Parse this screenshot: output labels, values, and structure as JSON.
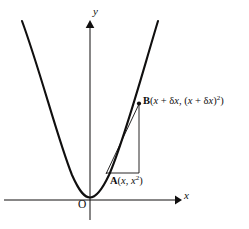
{
  "figure": {
    "background_color": "#ffffff",
    "stroke_color": "#100f0f",
    "width": 249,
    "height": 229
  },
  "axes": {
    "x_label": "x",
    "y_label": "y",
    "origin_label": "O",
    "x_axis": {
      "y": 200,
      "x_start": 4,
      "x_end": 178,
      "arrow": "right"
    },
    "y_axis": {
      "x": 90,
      "y_start": 220,
      "y_end": 22,
      "arrow": "up"
    }
  },
  "points": [
    {
      "id": "A",
      "name": "point-a",
      "label_parts": {
        "point": "A",
        "open": "(",
        "x": "x",
        "comma": ", ",
        "y_base": "x",
        "y_exp": "2",
        "close": ")"
      },
      "label_text": "A(x, x²)",
      "coords": {
        "x": 107,
        "y": 172
      }
    },
    {
      "id": "B",
      "name": "point-b",
      "label_parts": {
        "point": "B",
        "open": "(",
        "x_var": "x",
        "plus": " + ",
        "delta": "δ",
        "x2": "x",
        "comma": ", ",
        "inner_open": "(",
        "x3": "x",
        "plus2": " + ",
        "delta2": "δ",
        "x4": "x",
        "inner_close": ")",
        "exp": "2",
        "close": ")"
      },
      "label_text": "B(x + δx, (x + δx)²)",
      "coords": {
        "x": 139,
        "y": 104
      }
    }
  ],
  "curve": {
    "name": "parabola",
    "equation": "y = x²",
    "vertex": {
      "x": 90,
      "y": 197
    },
    "path": "M 22,21 C 40,70 58,140 72,175 C 80,193 85,197 90,197 C 95,197 101,192 109,175 C 124,141 142,74 158,21"
  },
  "secant": {
    "name": "secant-chord-ab",
    "from": "A",
    "to": "B",
    "path": "M 106,174 L 139,104"
  },
  "triangle": {
    "name": "delta-right-triangle",
    "horizontal_leg": {
      "x1": 106,
      "y1": 173,
      "x2": 139,
      "y2": 173
    },
    "vertical_leg": {
      "x1": 139,
      "y1": 173,
      "x2": 139,
      "y2": 104
    }
  }
}
